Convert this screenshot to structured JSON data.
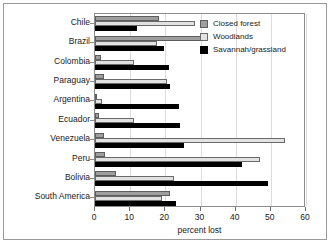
{
  "chart_data": {
    "type": "bar",
    "orientation": "horizontal",
    "title": "",
    "xlabel": "percent lost",
    "ylabel": "",
    "xlim": [
      0,
      60
    ],
    "xticks": [
      0,
      10,
      20,
      30,
      40,
      50,
      60
    ],
    "xtick_labels": [
      "0",
      "10",
      "20",
      "30",
      "40",
      "50",
      "60"
    ],
    "grid": true,
    "grid_axis": "x",
    "legend_position": "top-right",
    "categories": [
      "Chile",
      "Brazil",
      "Colombia",
      "Paraguay",
      "Argentina",
      "Ecuador",
      "Venezuela",
      "Peru",
      "Bolivia",
      "South America"
    ],
    "series": [
      {
        "name": "Closed forest",
        "color": "#9e9e9e",
        "values": [
          18.1,
          32.1,
          1.7,
          2.5,
          0.5,
          1.0,
          2.5,
          2.9,
          6.0,
          21.4
        ]
      },
      {
        "name": "Woodlands",
        "color": "#e2e2e2",
        "values": [
          28.3,
          17.5,
          11.0,
          20.5,
          2.0,
          11.2,
          53.9,
          46.8,
          22.4,
          19.1
        ]
      },
      {
        "name": "Savannah/grassland",
        "color": "#000000",
        "values": [
          12.0,
          19.5,
          21.0,
          21.2,
          24.0,
          24.3,
          25.3,
          41.8,
          49.2,
          23.1
        ]
      }
    ]
  },
  "legend": {
    "items": [
      {
        "label": "Closed forest",
        "class": "closed"
      },
      {
        "label": "Woodlands",
        "class": "wood"
      },
      {
        "label": "Savannah/grassland",
        "class": "sav"
      }
    ]
  },
  "axis": {
    "x_title": "percent lost"
  }
}
